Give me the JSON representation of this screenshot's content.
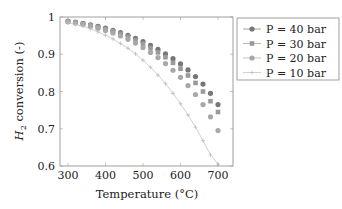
{
  "chart_data": {
    "type": "scatter",
    "title": "",
    "xlabel": "Temperature (°C)",
    "ylabel": "H2 conversion (-)",
    "xlim": [
      285,
      725
    ],
    "ylim": [
      0.6,
      1.0
    ],
    "xticks": [
      300,
      400,
      500,
      600,
      700
    ],
    "yticks": [
      0.6,
      0.7,
      0.8,
      0.9,
      1.0
    ],
    "ytick_labels": [
      "0.6",
      "0.7",
      "0.8",
      "0.9",
      "1"
    ],
    "grid": false,
    "legend_position": "outside-right-top",
    "x": [
      300,
      320,
      340,
      360,
      380,
      400,
      420,
      440,
      460,
      480,
      500,
      520,
      540,
      560,
      580,
      600,
      620,
      640,
      660,
      680,
      700
    ],
    "series": [
      {
        "name": "P = 40 bar",
        "marker": "circle",
        "color": "#777777",
        "values": [
          0.989,
          0.986,
          0.983,
          0.979,
          0.975,
          0.97,
          0.964,
          0.958,
          0.951,
          0.943,
          0.934,
          0.924,
          0.913,
          0.901,
          0.888,
          0.874,
          0.858,
          0.84,
          0.82,
          0.795,
          0.765
        ]
      },
      {
        "name": "P = 30 bar",
        "marker": "square",
        "color": "#9a9a9a",
        "values": [
          0.988,
          0.985,
          0.982,
          0.978,
          0.973,
          0.968,
          0.962,
          0.955,
          0.947,
          0.938,
          0.928,
          0.917,
          0.905,
          0.892,
          0.877,
          0.861,
          0.843,
          0.823,
          0.8,
          0.774,
          0.745
        ]
      },
      {
        "name": "P = 20 bar",
        "marker": "circle",
        "color": "#a8a8a8",
        "values": [
          0.987,
          0.984,
          0.98,
          0.975,
          0.97,
          0.964,
          0.957,
          0.949,
          0.94,
          0.93,
          0.918,
          0.905,
          0.891,
          0.875,
          0.857,
          0.838,
          0.816,
          0.792,
          0.765,
          0.732,
          0.695
        ]
      },
      {
        "name": "P = 10 bar",
        "marker": "plus",
        "color": "#bdbdbd",
        "values": [
          0.985,
          0.98,
          0.975,
          0.968,
          0.96,
          0.951,
          0.941,
          0.929,
          0.916,
          0.901,
          0.884,
          0.865,
          0.844,
          0.821,
          0.795,
          0.767,
          0.737,
          0.704,
          0.668,
          0.63,
          0.605
        ]
      }
    ]
  }
}
